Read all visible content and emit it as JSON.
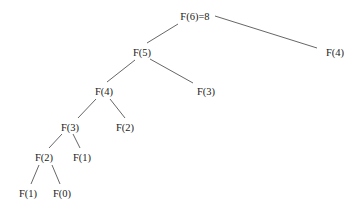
{
  "diagram": {
    "type": "recursion-tree",
    "nodes": [
      {
        "id": "n0",
        "label": "F(6)=8",
        "x": 195,
        "y": 20
      },
      {
        "id": "n1",
        "label": "F(5)",
        "x": 142,
        "y": 56
      },
      {
        "id": "n2",
        "label": "F(4)",
        "x": 335,
        "y": 56
      },
      {
        "id": "n3",
        "label": "F(4)",
        "x": 104,
        "y": 95
      },
      {
        "id": "n4",
        "label": "F(3)",
        "x": 206,
        "y": 95
      },
      {
        "id": "n5",
        "label": "F(3)",
        "x": 70,
        "y": 131
      },
      {
        "id": "n6",
        "label": "F(2)",
        "x": 125,
        "y": 131
      },
      {
        "id": "n7",
        "label": "F(2)",
        "x": 44,
        "y": 161
      },
      {
        "id": "n8",
        "label": "F(1)",
        "x": 82,
        "y": 161
      },
      {
        "id": "n9",
        "label": "F(1)",
        "x": 28,
        "y": 197
      },
      {
        "id": "n10",
        "label": "F(0)",
        "x": 62,
        "y": 197
      }
    ],
    "edges": [
      {
        "from": "n0",
        "to": "n1",
        "x1": 178,
        "y1": 24,
        "x2": 147,
        "y2": 43
      },
      {
        "from": "n0",
        "to": "n2",
        "x1": 215,
        "y1": 16,
        "x2": 317,
        "y2": 48
      },
      {
        "from": "n1",
        "to": "n3",
        "x1": 135,
        "y1": 60,
        "x2": 107,
        "y2": 82
      },
      {
        "from": "n1",
        "to": "n4",
        "x1": 150,
        "y1": 59,
        "x2": 193,
        "y2": 83
      },
      {
        "from": "n3",
        "to": "n5",
        "x1": 96,
        "y1": 99,
        "x2": 78,
        "y2": 118
      },
      {
        "from": "n3",
        "to": "n6",
        "x1": 110,
        "y1": 99,
        "x2": 125,
        "y2": 118
      },
      {
        "from": "n5",
        "to": "n7",
        "x1": 62,
        "y1": 134,
        "x2": 49,
        "y2": 148
      },
      {
        "from": "n5",
        "to": "n8",
        "x1": 73,
        "y1": 134,
        "x2": 80,
        "y2": 148
      },
      {
        "from": "n7",
        "to": "n9",
        "x1": 39,
        "y1": 165,
        "x2": 31,
        "y2": 184
      },
      {
        "from": "n7",
        "to": "n10",
        "x1": 52,
        "y1": 165,
        "x2": 60,
        "y2": 184
      }
    ]
  }
}
